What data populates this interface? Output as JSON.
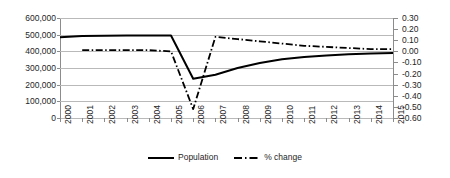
{
  "chart_data": {
    "type": "line",
    "title": "",
    "xlabel": "",
    "ylabel": "",
    "y2label": "",
    "grid": true,
    "legend_position": "bottom-center",
    "categories": [
      "2000",
      "2001",
      "2002",
      "2003",
      "2004",
      "2005",
      "2006",
      "2007",
      "2008",
      "2009",
      "2010",
      "2011",
      "2012",
      "2013",
      "2014",
      "2015"
    ],
    "ylim": [
      0,
      600000
    ],
    "yticks": [
      "0",
      "100,000",
      "200,000",
      "300,000",
      "400,000",
      "500,000",
      "600,000"
    ],
    "ytick_values": [
      0,
      100000,
      200000,
      300000,
      400000,
      500000,
      600000
    ],
    "y2lim": [
      -0.6,
      0.3
    ],
    "y2ticks": [
      "-0.60",
      "-0.50",
      "-0.40",
      "-0.30",
      "-0.20",
      "-0.10",
      "0.00",
      "0.10",
      "0.20",
      "0.30"
    ],
    "y2tick_values": [
      -0.6,
      -0.5,
      -0.4,
      -0.3,
      -0.2,
      -0.1,
      0.0,
      0.1,
      0.2,
      0.3
    ],
    "series": [
      {
        "name": "Population",
        "axis": "left",
        "style": "solid",
        "color": "#000000",
        "values": [
          485000,
          492000,
          494000,
          495000,
          495000,
          495000,
          235000,
          260000,
          300000,
          330000,
          352000,
          366000,
          375000,
          382000,
          387000,
          390000
        ]
      },
      {
        "name": "% change",
        "axis": "right",
        "style": "dash-dot",
        "color": "#000000",
        "values": [
          null,
          0.01,
          0.01,
          0.01,
          0.01,
          0.0,
          -0.52,
          0.13,
          0.11,
          0.09,
          0.07,
          0.05,
          0.04,
          0.03,
          0.02,
          0.02
        ]
      }
    ]
  },
  "legend": {
    "items": [
      {
        "label": "Population",
        "style": "solid"
      },
      {
        "label": "% change",
        "style": "dash-dot"
      }
    ]
  }
}
